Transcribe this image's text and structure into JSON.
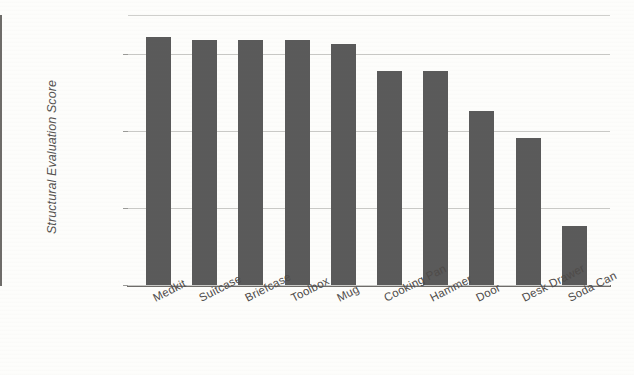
{
  "chart_data": {
    "type": "bar",
    "title": "",
    "xlabel": "",
    "ylabel": "Structural Evaluation Score",
    "ylim": [
      2.8,
      3.15
    ],
    "yticks": [
      "2.8",
      "2.9",
      "3",
      "3.1"
    ],
    "ytick_values": [
      2.8,
      2.9,
      3.0,
      3.1
    ],
    "grid": true,
    "legend": "none",
    "bar_color": "#5a5a5a",
    "categories": [
      "Medkit",
      "Suitcase",
      "Briefcase",
      "Toolbox",
      "Mug",
      "Cooking Pan",
      "Hammer",
      "Door",
      "Desk Drawer",
      "Soda Can"
    ],
    "values": [
      3.122,
      3.118,
      3.118,
      3.118,
      3.113,
      3.078,
      3.078,
      3.026,
      2.991,
      2.877
    ]
  },
  "axes": {
    "y_title": "Structural Evaluation Score",
    "y_tick_labels": [
      "3.1",
      "3",
      "2.9",
      "2.8"
    ]
  }
}
